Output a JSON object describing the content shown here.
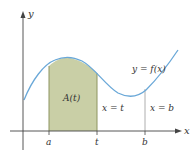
{
  "figure": {
    "axes": {
      "x_label": "x",
      "y_label": "y"
    },
    "function_label": "y = f(x)",
    "area_label": "A(t)",
    "ticks": {
      "a": "a",
      "t": "t",
      "b": "b"
    },
    "vertical_lines": {
      "t_label": "x = t",
      "b_label": "x = b"
    },
    "colors": {
      "curve": "#6aa8d8",
      "shaded_area": "#c9cfa6",
      "shade_edge": "#8d9460",
      "axis": "#444444",
      "text": "#333333"
    }
  }
}
